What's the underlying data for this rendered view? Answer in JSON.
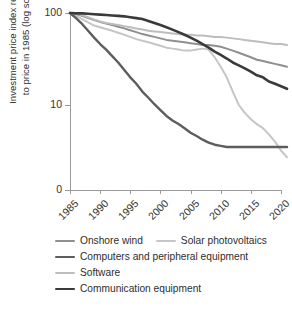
{
  "chart_data": {
    "type": "line",
    "title": "",
    "xlabel": "",
    "ylabel": "Investment price index relative\nto price in 1985 (log scale)",
    "yscale": "log",
    "ytick_labels": [
      "100",
      "10",
      "0"
    ],
    "ytick_values": [
      100,
      10,
      0
    ],
    "ylim": [
      2,
      100
    ],
    "xlim": [
      1985,
      2021
    ],
    "xtick_labels": [
      "1985",
      "1990",
      "1995",
      "2000",
      "2005",
      "2010",
      "2015",
      "2020"
    ],
    "xtick_values": [
      1985,
      1990,
      1995,
      2000,
      2005,
      2010,
      2015,
      2020
    ],
    "grid": false,
    "legend_position": "below",
    "x": [
      1985,
      1986,
      1987,
      1988,
      1989,
      1990,
      1991,
      1992,
      1993,
      1994,
      1995,
      1996,
      1997,
      1998,
      1999,
      2000,
      2001,
      2002,
      2003,
      2004,
      2005,
      2006,
      2007,
      2008,
      2009,
      2010,
      2011,
      2012,
      2013,
      2014,
      2015,
      2016,
      2017,
      2018,
      2019,
      2020,
      2021
    ],
    "series": [
      {
        "name": "Onshore wind",
        "color": "#8f8f8f",
        "width": 2.0,
        "values": [
          100,
          97,
          93,
          88,
          84,
          80,
          77,
          74,
          71,
          68,
          65,
          62,
          59,
          57,
          55,
          53,
          51,
          50,
          49,
          48,
          47,
          46,
          45,
          45,
          44,
          43,
          41,
          39,
          37,
          35,
          33,
          31,
          30,
          29,
          28,
          27,
          26
        ]
      },
      {
        "name": "Solar photovoltaics",
        "color": "#c6c6c6",
        "width": 2.0,
        "values": [
          100,
          93,
          86,
          79,
          73,
          70,
          67,
          64,
          61,
          58,
          55,
          52,
          50,
          48,
          46,
          44,
          42,
          41,
          40,
          39,
          39,
          40,
          41,
          40,
          33,
          26,
          20,
          14,
          10,
          8.2,
          7.0,
          6.2,
          5.6,
          4.8,
          4.0,
          3.2,
          2.7
        ]
      },
      {
        "name": "Computers and peripheral equipment",
        "color": "#5d5d5d",
        "width": 2.4,
        "values": [
          100,
          88,
          76,
          64,
          54,
          46,
          40,
          34,
          29,
          24,
          20,
          17,
          14,
          12,
          10.2,
          8.8,
          7.6,
          6.8,
          6.2,
          5.6,
          5.0,
          4.6,
          4.2,
          3.9,
          3.7,
          3.6,
          3.5,
          3.5,
          3.5,
          3.5,
          3.5,
          3.5,
          3.5,
          3.5,
          3.5,
          3.5,
          3.5
        ]
      },
      {
        "name": "Software",
        "color": "#bdbdbd",
        "width": 2.0,
        "values": [
          100,
          98,
          95,
          90,
          85,
          81,
          78,
          76,
          74,
          72,
          70,
          68,
          66,
          64,
          63,
          62,
          61,
          60,
          59,
          58,
          58,
          57,
          57,
          56,
          55,
          55,
          54,
          53,
          52,
          51,
          50,
          49,
          48,
          47,
          46,
          46,
          45
        ]
      },
      {
        "name": "Communication equipment",
        "color": "#3a3a3a",
        "width": 2.6,
        "values": [
          100,
          99,
          99,
          98,
          97,
          96,
          95,
          94,
          93,
          92,
          90,
          88,
          86,
          82,
          78,
          74,
          70,
          66,
          62,
          58,
          54,
          50,
          46,
          42,
          38,
          35,
          32,
          29,
          27,
          25,
          23,
          21,
          20,
          18,
          17,
          16,
          15
        ]
      }
    ]
  },
  "legend": {
    "items": [
      {
        "label": "Onshore wind"
      },
      {
        "label": "Solar photovoltaics"
      },
      {
        "label": "Computers and peripheral equipment"
      },
      {
        "label": "Software"
      },
      {
        "label": "Communication equipment"
      }
    ]
  }
}
